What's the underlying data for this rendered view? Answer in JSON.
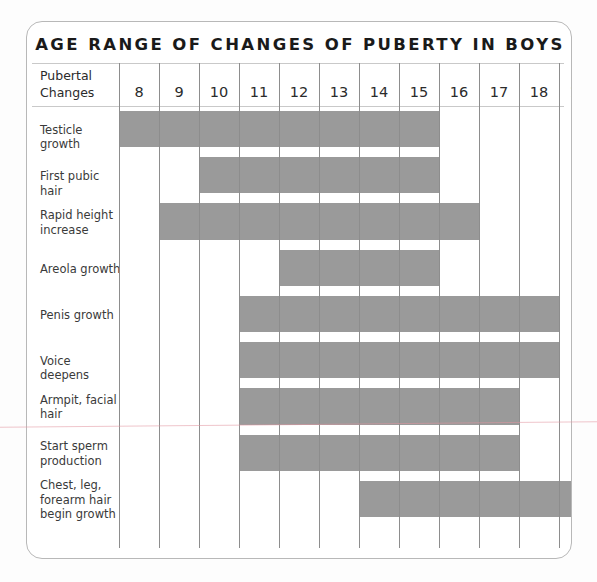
{
  "chart_data": {
    "type": "bar",
    "title": "AGE RANGE OF CHANGES OF PUBERTY IN BOYS",
    "xlabel": "",
    "ylabel": "Pubertal Changes",
    "orientation": "horizontal",
    "bar_color": "#9a9a9a",
    "grid": true,
    "legend": "none",
    "categories": [
      8,
      9,
      10,
      11,
      12,
      13,
      14,
      15,
      16,
      17,
      18,
      19
    ],
    "xlim": [
      8,
      20
    ],
    "axis_tick_labels": [
      "8",
      "9",
      "10",
      "11",
      "12",
      "13",
      "14",
      "15",
      "16",
      "17",
      "18",
      "19"
    ],
    "row_header_label": "Pubertal\nChanges",
    "series": [
      {
        "name": "Testicle growth",
        "start_age": 8,
        "end_age": 16
      },
      {
        "name": "First pubic hair",
        "start_age": 10,
        "end_age": 16
      },
      {
        "name": "Rapid height increase",
        "start_age": 9,
        "end_age": 17
      },
      {
        "name": "Areola growth",
        "start_age": 12,
        "end_age": 16
      },
      {
        "name": "Penis growth",
        "start_age": 11,
        "end_age": 19
      },
      {
        "name": "Voice deepens",
        "start_age": 11,
        "end_age": 19
      },
      {
        "name": "Armpit, facial hair",
        "start_age": 11,
        "end_age": 18
      },
      {
        "name": "Start sperm production",
        "start_age": 11,
        "end_age": 18
      },
      {
        "name": "Chest, leg, forearm hair begin growth",
        "start_age": 14,
        "end_age": 20
      }
    ]
  },
  "header": {
    "title": "AGE RANGE OF CHANGES OF PUBERTY IN BOYS",
    "corner_line1": "Pubertal",
    "corner_line2": "Changes"
  },
  "columns": [
    {
      "label": "8"
    },
    {
      "label": "9"
    },
    {
      "label": "10"
    },
    {
      "label": "11"
    },
    {
      "label": "12"
    },
    {
      "label": "13"
    },
    {
      "label": "14"
    },
    {
      "label": "15"
    },
    {
      "label": "16"
    },
    {
      "label": "17"
    },
    {
      "label": "18"
    },
    {
      "label": "19"
    }
  ],
  "rows": [
    {
      "label": "Testicle growth",
      "lines": [
        "Testicle growth"
      ]
    },
    {
      "label": "First pubic hair",
      "lines": [
        "First pubic hair"
      ]
    },
    {
      "label": "Rapid height increase",
      "lines": [
        "Rapid height",
        "increase"
      ]
    },
    {
      "label": "Areola growth",
      "lines": [
        "Areola growth"
      ]
    },
    {
      "label": "Penis growth",
      "lines": [
        "Penis growth"
      ]
    },
    {
      "label": "Voice deepens",
      "lines": [
        "Voice deepens"
      ]
    },
    {
      "label": "Armpit, facial hair",
      "lines": [
        "Armpit, facial",
        "hair"
      ]
    },
    {
      "label": "Start sperm production",
      "lines": [
        "Start sperm",
        "production"
      ]
    },
    {
      "label": "Chest, leg, forearm hair begin growth",
      "lines": [
        "Chest, leg,",
        "forearm hair",
        "begin growth"
      ]
    }
  ]
}
